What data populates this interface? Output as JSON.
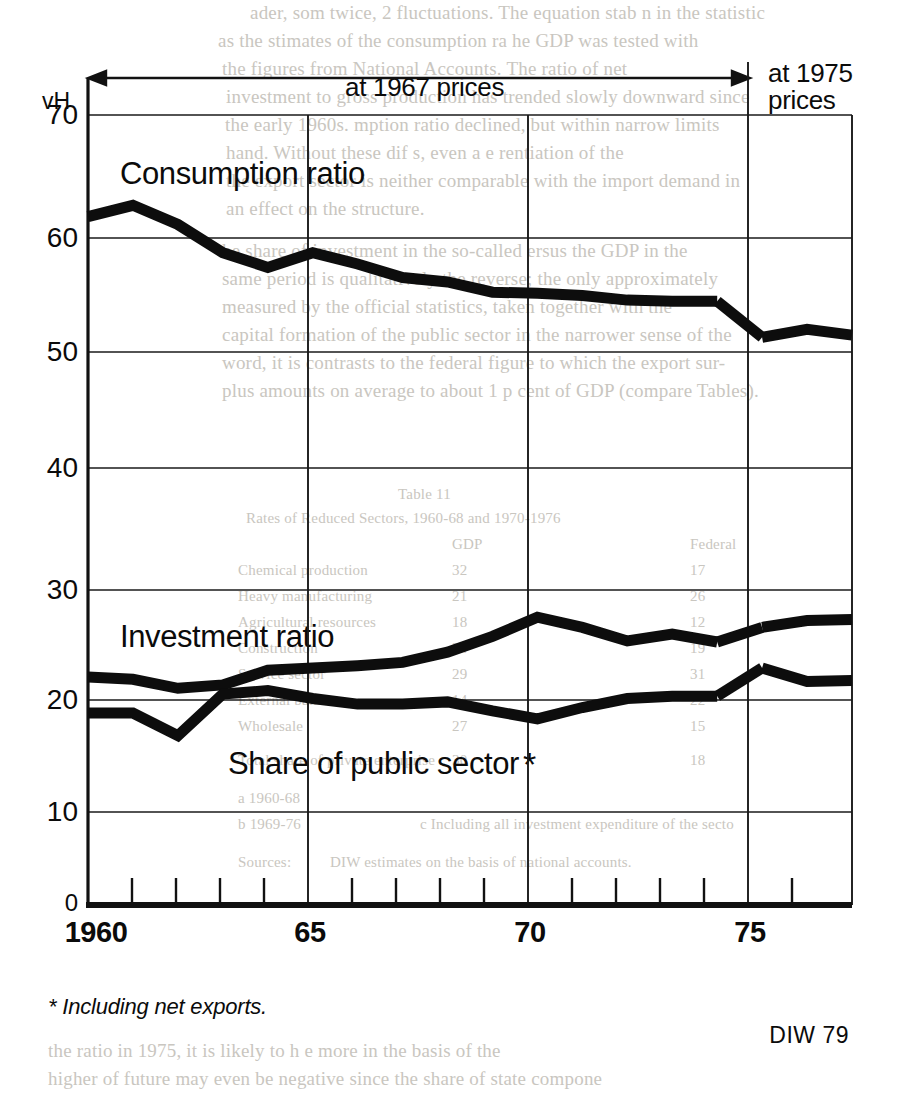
{
  "figure": {
    "unit_label": "vH",
    "top_annotations": {
      "left_span": "at 1967 prices",
      "right_span_line1": "at 1975",
      "right_span_line2": "prices"
    },
    "footnote": "* Including net exports.",
    "source": "DIW 79"
  },
  "series_labels": {
    "consumption": "Consumption ratio",
    "investment": "Investment ratio",
    "public_sector": "Share of public sector",
    "public_sector_marker": "*"
  },
  "axis": {
    "y_ticks": [
      "70",
      "60",
      "50",
      "40",
      "30",
      "20",
      "10",
      "0"
    ],
    "x_ticks": [
      "1960",
      "65",
      "70",
      "75"
    ]
  },
  "chart_data": {
    "type": "line",
    "title": "",
    "subtitle": "",
    "xlabel": "",
    "ylabel": "vH",
    "xlim": [
      1960,
      1977
    ],
    "ylim": [
      0,
      70
    ],
    "grid": true,
    "legend": "inline-labels",
    "x": [
      1960,
      1961,
      1962,
      1963,
      1964,
      1965,
      1966,
      1967,
      1968,
      1969,
      1970,
      1971,
      1972,
      1973,
      1974,
      1975,
      1976,
      1977
    ],
    "categories": [
      "1960",
      "1961",
      "1962",
      "1963",
      "1964",
      "1965",
      "1966",
      "1967",
      "1968",
      "1969",
      "1970",
      "1971",
      "1972",
      "1973",
      "1974",
      "1975",
      "1976",
      "1977"
    ],
    "annotations": [
      {
        "text": "at 1967 prices",
        "x_range": [
          1960,
          1975
        ]
      },
      {
        "text": "at 1975 prices",
        "x_range": [
          1975,
          1977
        ]
      },
      {
        "text": "* Including net exports."
      },
      {
        "text": "DIW 79"
      }
    ],
    "price_base_break_at": 1975,
    "series": [
      {
        "name": "Consumption ratio",
        "values": [
          61.0,
          62.0,
          60.3,
          57.8,
          56.5,
          57.8,
          56.8,
          55.6,
          55.2,
          54.3,
          54.2,
          54.0,
          53.6,
          53.5,
          53.5,
          50.3,
          51.0,
          50.5
        ]
      },
      {
        "name": "Investment ratio",
        "values": [
          20.2,
          20.0,
          19.2,
          19.5,
          20.8,
          21.0,
          21.2,
          21.5,
          22.4,
          23.8,
          25.5,
          24.6,
          23.4,
          24.0,
          23.3,
          24.6,
          25.2,
          25.3
        ]
      },
      {
        "name": "Share of public sector",
        "values": [
          17.0,
          17.0,
          15.0,
          18.7,
          19.0,
          18.3,
          17.8,
          17.8,
          18.0,
          17.2,
          16.5,
          17.5,
          18.3,
          18.5,
          18.5,
          21.0,
          19.8,
          19.9
        ]
      }
    ]
  }
}
